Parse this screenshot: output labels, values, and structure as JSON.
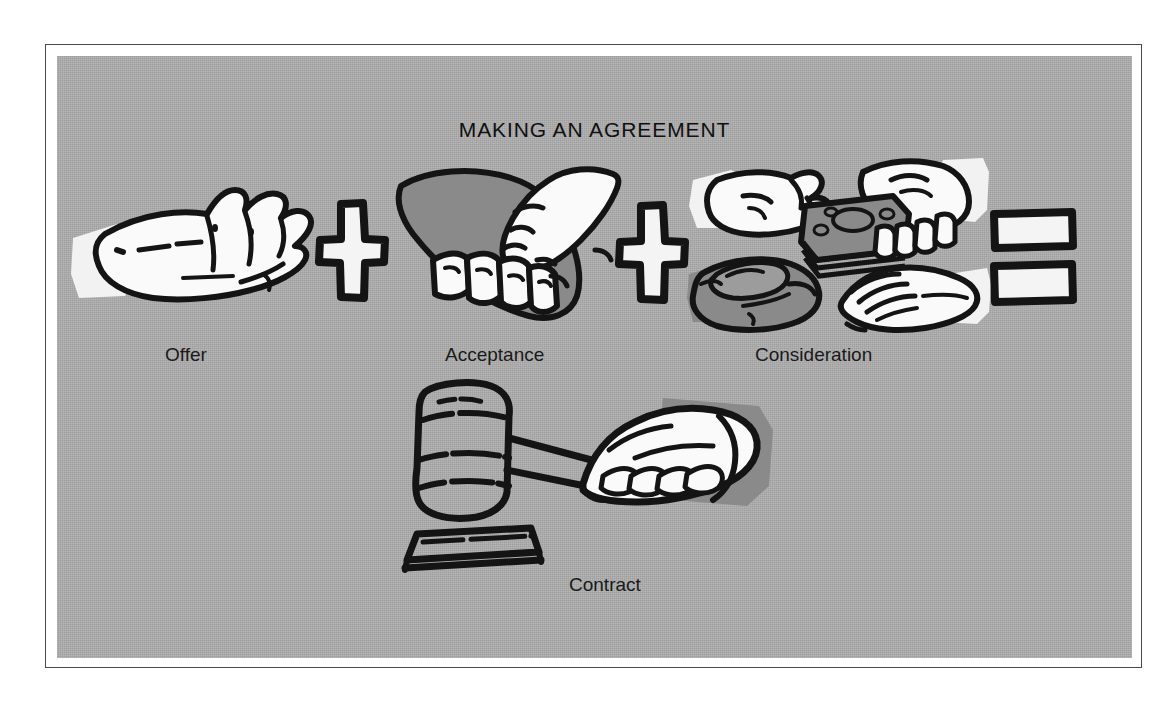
{
  "illustration": {
    "title": "MAKING AN AGREEMENT",
    "background_color": "#adadad",
    "ink_color": "#101010",
    "light_fill_color": "#f2f2f2",
    "shadow_fill_color": "#8a8a8a",
    "frame_color": "#4a4a4a",
    "equation": {
      "operator_plus": "+",
      "operator_equals": "=",
      "terms": [
        {
          "label": "Offer",
          "icon": "open-palm-hand-icon"
        },
        {
          "label": "Acceptance",
          "icon": "handshake-icon"
        },
        {
          "label": "Consideration",
          "icon": "hands-exchanging-money-icon"
        }
      ],
      "result": {
        "label": "Contract",
        "icon": "gavel-in-hand-icon"
      }
    },
    "captions": {
      "offer": "Offer",
      "acceptance": "Acceptance",
      "consideration": "Consideration",
      "contract": "Contract"
    }
  }
}
